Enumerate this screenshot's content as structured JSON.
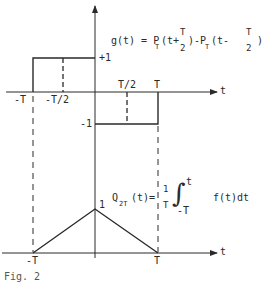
{
  "figure": {
    "caption": "Fig. 2",
    "top_plot": {
      "axis_label": "t",
      "equation": {
        "lhs": "g(t) = P",
        "sub1": "T",
        "mid1": "(t+",
        "frac1_num": "T",
        "frac1_den": "2",
        "mid2": ")-P",
        "sub2": "T",
        "mid3": "(t-",
        "frac2_num": "T",
        "frac2_den": "2",
        "end": ")"
      },
      "levels": {
        "plus_one": "+1",
        "minus_one": "-1"
      },
      "ticks": {
        "neg_T": "-T",
        "neg_half_T": "-T/2",
        "half_T": "T/2",
        "T": "T"
      }
    },
    "bottom_plot": {
      "axis_label": "t",
      "peak_label": "1",
      "equation": {
        "lhs": "Q",
        "sub": "2T",
        "arg": "(t)=",
        "frac_num": "1",
        "frac_den": "T",
        "int_upper": "t",
        "int_lower": "-T",
        "integrand": "f(t)dt"
      },
      "ticks": {
        "neg_T": "-T",
        "T": "T"
      }
    },
    "colors": {
      "ink": "#2a2a2a",
      "background": "#ffffff"
    }
  }
}
